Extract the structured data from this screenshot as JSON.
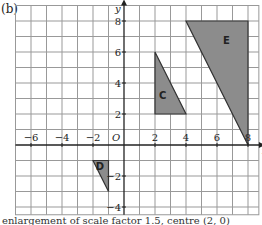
{
  "part_label": "(b)",
  "caption": "enlargement of scale factor 1.5, centre (2, 0)",
  "axes": {
    "x_label": "x",
    "y_label": "y",
    "origin_label": "O",
    "x_ticks": [
      -6,
      -4,
      -2,
      2,
      4,
      6,
      8
    ],
    "y_ticks": [
      8,
      6,
      4,
      2,
      -2,
      -4
    ],
    "x_range": [
      -7,
      8.7
    ],
    "y_range": [
      -4.5,
      9
    ]
  },
  "shapes": [
    {
      "label": "C",
      "vertices": [
        [
          2,
          2
        ],
        [
          2,
          6
        ],
        [
          4,
          2
        ]
      ],
      "label_pos": [
        2.5,
        3
      ]
    },
    {
      "label": "E",
      "vertices": [
        [
          4,
          8
        ],
        [
          8,
          8
        ],
        [
          8,
          0
        ]
      ],
      "label_pos": [
        6.6,
        6.5
      ]
    },
    {
      "label": "D",
      "vertices": [
        [
          -2,
          -1
        ],
        [
          -1,
          -1
        ],
        [
          -1,
          -3
        ]
      ],
      "label_pos": [
        -1.55,
        -1.6
      ]
    }
  ],
  "colors": {
    "fill": "#8c8c8c",
    "grid": "#999999",
    "axis": "#222222"
  }
}
